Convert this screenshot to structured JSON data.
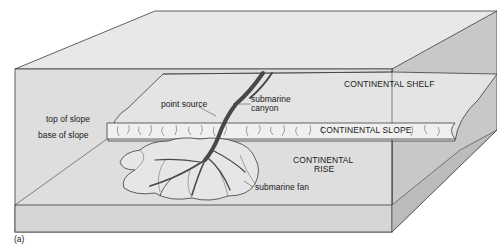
{
  "figure": {
    "panel_label": "(a)",
    "colors": {
      "top_surface": "#e6e6e6",
      "front_face": "#dcdcdc",
      "side_face": "#c4c4c4",
      "shelf_region": "#e2e2e2",
      "slope_band": "#f2f2f2",
      "fan_fill": "#e8e8e8",
      "canyon_fill": "#4a4a4a",
      "outline": "#3c3c3c"
    },
    "labels": {
      "top_of_slope": "top of slope",
      "base_of_slope": "base of slope",
      "point_source": "point source",
      "submarine_canyon_line1": "submarine",
      "submarine_canyon_line2": "canyon",
      "continental_shelf": "CONTINENTAL SHELF",
      "continental_slope": "CONTINENTAL SLOPE",
      "continental_rise_line1": "CONTINENTAL",
      "continental_rise_line2": "RISE",
      "submarine_fan": "submarine fan"
    }
  }
}
